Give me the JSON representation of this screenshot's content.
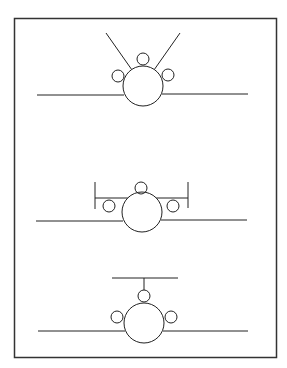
{
  "figure": {
    "stroke_color": "#222222",
    "border_color": "#333333",
    "background": "#ffffff",
    "panels": [
      {
        "name": "v-tail",
        "label": "V-tail with three engines"
      },
      {
        "name": "h-tail-endplates",
        "label": "Horizontal tail with endplates, three engines"
      },
      {
        "name": "t-tail",
        "label": "T-tail with three engines"
      }
    ]
  }
}
